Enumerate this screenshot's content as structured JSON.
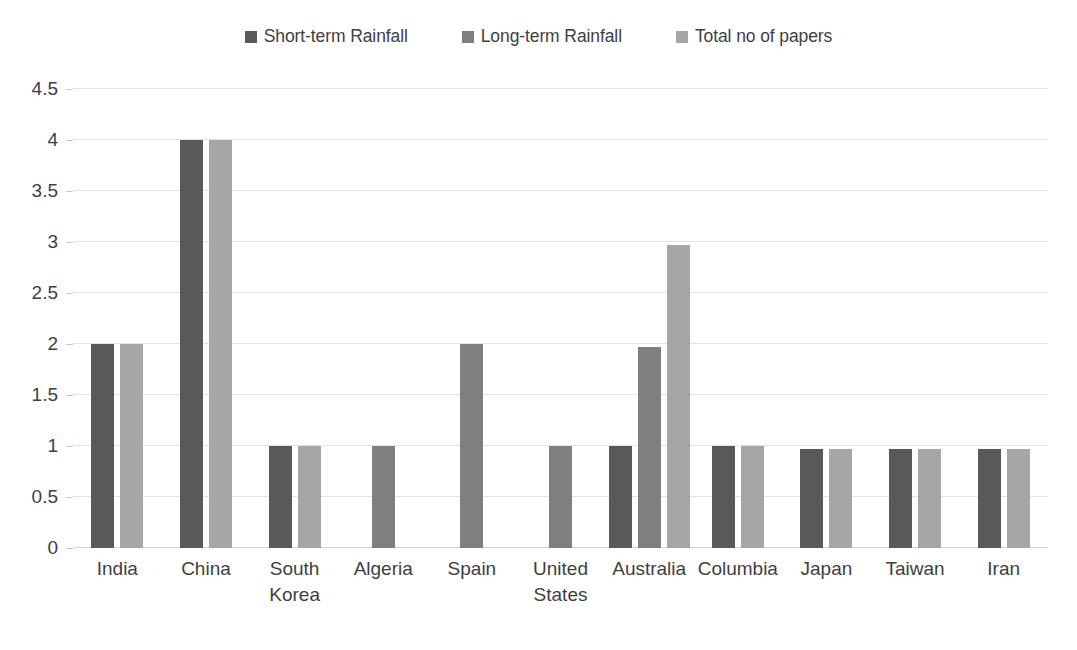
{
  "chart_data": {
    "type": "bar",
    "title": "",
    "subtitle": "",
    "xlabel": "",
    "ylabel": "",
    "ylim": [
      0,
      4.5
    ],
    "yticks": [
      "0",
      "0.5",
      "1",
      "1.5",
      "2",
      "2.5",
      "3",
      "3.5",
      "4",
      "4.5"
    ],
    "ytick_values": [
      0,
      0.5,
      1,
      1.5,
      2,
      2.5,
      3,
      3.5,
      4,
      4.5
    ],
    "grid": true,
    "legend_position": "top-center",
    "categories": [
      "India",
      "China",
      "South Korea",
      "Algeria",
      "Spain",
      "United States",
      "Australia",
      "Columbia",
      "Japan",
      "Taiwan",
      "Iran"
    ],
    "series": [
      {
        "name": "Short-term Rainfall",
        "color": "#595959",
        "values": [
          2,
          4,
          1,
          null,
          null,
          null,
          1,
          1,
          0.97,
          0.97,
          0.97
        ]
      },
      {
        "name": "Long-term Rainfall",
        "color": "#7f7f7f",
        "values": [
          null,
          null,
          null,
          1,
          2,
          1,
          1.97,
          null,
          null,
          null,
          null
        ]
      },
      {
        "name": "Total no of papers",
        "color": "#a6a6a6",
        "values": [
          2,
          4,
          1,
          null,
          null,
          null,
          2.97,
          1,
          0.97,
          0.97,
          0.97
        ]
      }
    ]
  },
  "legend": {
    "items": [
      {
        "label": "Short-term Rainfall",
        "color": "#595959"
      },
      {
        "label": "Long-term Rainfall",
        "color": "#7f7f7f"
      },
      {
        "label": "Total no of papers",
        "color": "#a6a6a6"
      }
    ]
  },
  "colors": {
    "short_term": "#595959",
    "long_term": "#7f7f7f",
    "total_papers": "#a6a6a6",
    "gridline": "#e3e3e3",
    "text": "#3f3f3f",
    "background": "#ffffff"
  }
}
